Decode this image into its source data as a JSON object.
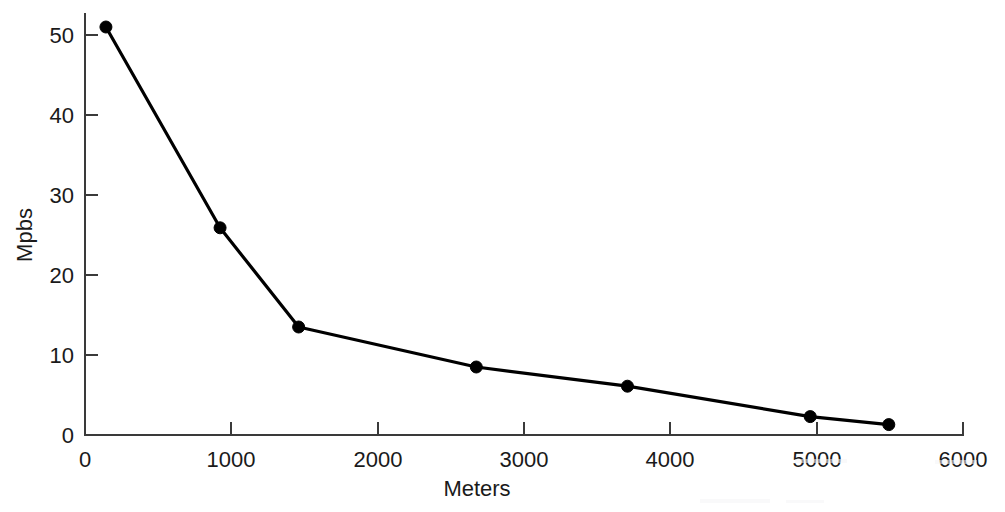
{
  "chart_data": {
    "type": "line",
    "title": "",
    "xlabel": "Meters",
    "ylabel": "Mpbs",
    "xlim": [
      0,
      6000
    ],
    "ylim": [
      0,
      55
    ],
    "xticks": [
      0,
      1000,
      2000,
      3000,
      4000,
      5000,
      6000
    ],
    "xtick_labels": [
      "0",
      "1000",
      "2000",
      "3000",
      "4000",
      "5000",
      "6000"
    ],
    "yticks": [
      0,
      10,
      20,
      30,
      40,
      50
    ],
    "ytick_labels": [
      "0",
      "10",
      "20",
      "30",
      "40",
      "50"
    ],
    "grid": false,
    "legend": "none",
    "marker": "filled-circle",
    "line_color": "#000000",
    "marker_color": "#000000",
    "axis_color": "#3a3a3a",
    "background_color": "#ffffff",
    "series": [
      {
        "name": "Throughput vs Distance",
        "x": [
          143,
          923,
          1460,
          2674,
          3707,
          4956,
          5493
        ],
        "values": [
          51.0,
          25.9,
          13.5,
          8.5,
          6.1,
          2.3,
          1.3
        ]
      }
    ]
  },
  "axes": {
    "x_axis_title": "Meters",
    "y_axis_title": "Mpbs"
  }
}
